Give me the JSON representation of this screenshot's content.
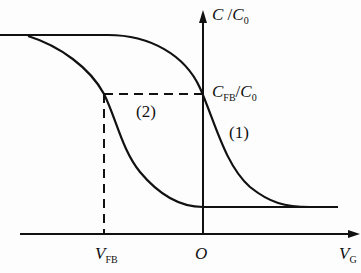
{
  "diagram": {
    "type": "C-V characteristic curves",
    "y_axis": {
      "label_main": "C",
      "label_sep": " /",
      "label_den": "C",
      "label_den_sub": "0"
    },
    "x_axis": {
      "label_main": "V",
      "label_sub": "G"
    },
    "origin_label": "O",
    "vfb_label": {
      "main": "V",
      "sub": "FB"
    },
    "cfb_label": {
      "main": "C",
      "sub": "FB",
      "sep": "/",
      "den": "C",
      "den_sub": "0"
    },
    "curves": [
      {
        "id": "1",
        "label": "(1)"
      },
      {
        "id": "2",
        "label": "(2)"
      }
    ],
    "colors": {
      "line": "#111111",
      "background": "#fdfdfd"
    }
  }
}
